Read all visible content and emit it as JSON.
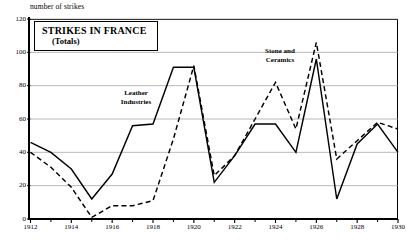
{
  "figure": {
    "axis_caption": "number of strikes",
    "title_line1": "STRIKES IN FRANCE",
    "title_line2": "(Totals)"
  },
  "chart_data": {
    "type": "line",
    "title": "STRIKES IN FRANCE (Totals)",
    "xlabel": "",
    "ylabel": "number of strikes",
    "ylim": [
      0,
      120
    ],
    "xlim": [
      1912,
      1930
    ],
    "yticks": [
      0,
      20,
      40,
      60,
      80,
      100,
      120
    ],
    "xticks": [
      1912,
      1914,
      1916,
      1918,
      1920,
      1922,
      1924,
      1926,
      1928,
      1930
    ],
    "xtick_labels": [
      "1912",
      "1914",
      "1916",
      "1918",
      "1920",
      "1922",
      "1924",
      "1926",
      "1928",
      "1930"
    ],
    "x_minor_ticks": [
      1913,
      1915,
      1917,
      1919,
      1921,
      1923,
      1925,
      1927,
      1929
    ],
    "grid": "horizontal",
    "legend_position": "inline-annotations",
    "x": [
      1912,
      1913,
      1914,
      1915,
      1916,
      1917,
      1918,
      1919,
      1920,
      1921,
      1922,
      1923,
      1924,
      1925,
      1926,
      1927,
      1928,
      1929,
      1930
    ],
    "series": [
      {
        "name": "Leather Industries",
        "style": "solid",
        "color": "#000000",
        "annotation": "Leather Industries",
        "values": [
          46,
          40,
          30,
          12,
          27,
          56,
          57,
          91,
          91,
          22,
          38,
          57,
          57,
          40,
          96,
          12,
          45,
          57,
          40
        ]
      },
      {
        "name": "Stone and Ceramics",
        "style": "dashed",
        "color": "#000000",
        "annotation": "Stone and Ceramics",
        "values": [
          40,
          31,
          19,
          1,
          8,
          8,
          11,
          48,
          92,
          26,
          38,
          60,
          82,
          54,
          106,
          36,
          47,
          58,
          54
        ]
      }
    ],
    "annotations": [
      {
        "text": "Leather Industries",
        "x": 1917.1,
        "y": 76
      },
      {
        "text": "Stone and Ceramics",
        "x": 1924.6,
        "y": 98
      }
    ]
  }
}
